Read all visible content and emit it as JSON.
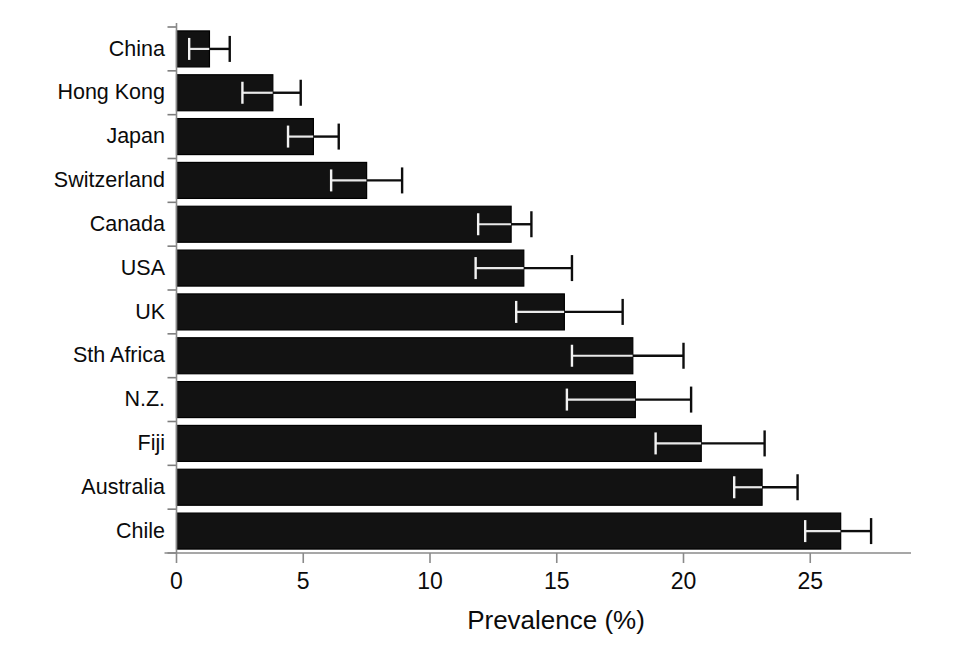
{
  "chart_data": {
    "type": "bar",
    "orientation": "horizontal",
    "title": "",
    "xlabel": "Prevalence (%)",
    "ylabel": "",
    "xlim": [
      0,
      29
    ],
    "xticks": [
      0,
      5,
      10,
      15,
      20,
      25
    ],
    "xtick_labels": [
      "0",
      "5",
      "10",
      "15",
      "20",
      "25"
    ],
    "grid": false,
    "legend": null,
    "categories": [
      "China",
      "Hong Kong",
      "Japan",
      "Switzerland",
      "Canada",
      "USA",
      "UK",
      "Sth Africa",
      "N.Z.",
      "Fiji",
      "Australia",
      "Chile"
    ],
    "values": [
      1.3,
      3.8,
      5.4,
      7.5,
      13.2,
      13.7,
      15.3,
      18.0,
      18.1,
      20.7,
      23.1,
      26.2
    ],
    "error_low": [
      0.5,
      2.6,
      4.4,
      6.1,
      11.9,
      11.8,
      13.4,
      15.6,
      15.4,
      18.9,
      22.0,
      24.8
    ],
    "error_high": [
      2.1,
      4.9,
      6.4,
      8.9,
      14.0,
      15.6,
      17.6,
      20.0,
      20.3,
      23.2,
      24.5,
      27.4
    ],
    "bar_color": "#121212",
    "error_bar_color": "#0d0d0d",
    "axis_color": "#8a8a8a"
  },
  "axis": {
    "x_title": "Prevalence (%)"
  }
}
